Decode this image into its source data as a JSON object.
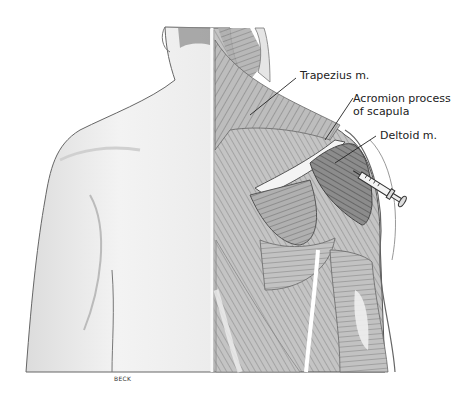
{
  "figure": {
    "labels": [
      {
        "id": "trapezius",
        "text": "Trapezius m."
      },
      {
        "id": "acromion",
        "line1": "Acromion process",
        "line2": "of scapula"
      },
      {
        "id": "deltoid",
        "text": "Deltoid m."
      }
    ],
    "credit": "BECK",
    "colors": {
      "skin": "#f2f2f2",
      "skin_shadow": "#d4d4d4",
      "muscle_light": "#c8c8c8",
      "muscle_dark": "#6e6e6e",
      "outline": "#555555",
      "leader_line": "#222222"
    }
  }
}
